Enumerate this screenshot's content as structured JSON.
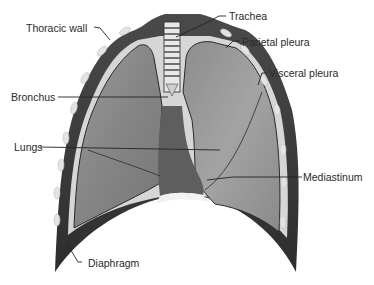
{
  "diagram": {
    "labels": [
      {
        "id": "thoracic-wall",
        "text": "Thoracic wall"
      },
      {
        "id": "trachea",
        "text": "Trachea"
      },
      {
        "id": "parietal-pleura",
        "text": "Parietal pleura"
      },
      {
        "id": "visceral-pleura",
        "text": "Visceral pleura"
      },
      {
        "id": "bronchus",
        "text": "Bronchus"
      },
      {
        "id": "lungs",
        "text": "Lungs"
      },
      {
        "id": "mediastinum",
        "text": "Mediastinum"
      },
      {
        "id": "diaphragm",
        "text": "Diaphragm"
      }
    ],
    "colors": {
      "wall": "#3a3a3a",
      "lung": "#8a8a8a",
      "lung_light": "#a6a6a6",
      "pleura": "#d8d8d8",
      "rib": "#e6e6e6",
      "leader": "#222222",
      "text": "#2a2a2a"
    }
  }
}
